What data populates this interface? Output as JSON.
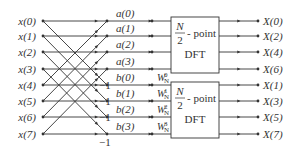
{
  "diagram": {
    "inputs": [
      "x(0)",
      "x(1)",
      "x(2)",
      "x(3)",
      "x(4)",
      "x(5)",
      "x(6)",
      "x(7)"
    ],
    "a_labels": [
      "a(0)",
      "a(1)",
      "a(2)",
      "a(3)"
    ],
    "b_labels": [
      "b(0)",
      "b(1)",
      "b(2)",
      "b(3)"
    ],
    "minus_one": "−1",
    "twiddles": [
      {
        "base": "W",
        "sub": "N",
        "sup": "0"
      },
      {
        "base": "W",
        "sub": "N",
        "sup": "1"
      },
      {
        "base": "W",
        "sub": "N",
        "sup": "2"
      },
      {
        "base": "W",
        "sub": "N",
        "sup": "3"
      }
    ],
    "dft_blocks": [
      {
        "numerator": "N",
        "denominator": "2",
        "suffix": "- point",
        "name": "DFT"
      },
      {
        "numerator": "N",
        "denominator": "2",
        "suffix": "- point",
        "name": "DFT"
      }
    ],
    "outputs": [
      "X(0)",
      "X(2)",
      "X(4)",
      "X(6)",
      "X(1)",
      "X(3)",
      "X(5)",
      "X(7)"
    ],
    "colors": {
      "line": "#333333",
      "background": "#ffffff"
    }
  }
}
